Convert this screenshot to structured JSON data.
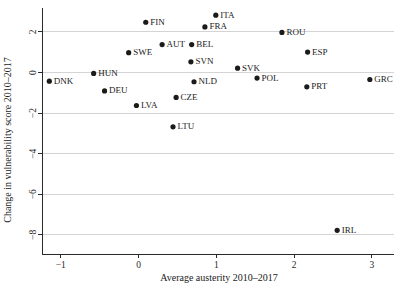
{
  "chart_data": {
    "type": "scatter",
    "title": "",
    "xlabel": "Average austerity 2010–2017",
    "ylabel": "Change in vulnerability score 2010–2017",
    "xlim": [
      -1.35,
      3.15
    ],
    "ylim": [
      -8.6,
      3.2
    ],
    "xticks": [
      -1,
      0,
      1,
      2,
      3
    ],
    "xtick_labels": [
      "−1",
      "0",
      "1",
      "2",
      "3"
    ],
    "yticks": [
      2,
      0,
      -2,
      -4,
      -6,
      -8
    ],
    "ytick_labels": [
      "2",
      "0",
      "−2",
      "−4",
      "−6",
      "−8"
    ],
    "grid": "horizontal",
    "gridlines_y": [
      2,
      0,
      -2,
      -4,
      -6,
      -8
    ],
    "legend": "none",
    "marker": "filled-circle",
    "marker_color": "#1b1b1b",
    "label_position": "right-of-marker",
    "points": [
      {
        "label": "DNK",
        "x": -1.14,
        "y": -0.45
      },
      {
        "label": "HUN",
        "x": -0.57,
        "y": -0.07
      },
      {
        "label": "DEU",
        "x": -0.43,
        "y": -0.93
      },
      {
        "label": "SWE",
        "x": -0.12,
        "y": 0.95
      },
      {
        "label": "LVA",
        "x": -0.02,
        "y": -1.65
      },
      {
        "label": "FIN",
        "x": 0.1,
        "y": 2.45
      },
      {
        "label": "AUT",
        "x": 0.31,
        "y": 1.35
      },
      {
        "label": "LTU",
        "x": 0.45,
        "y": -2.7
      },
      {
        "label": "CZE",
        "x": 0.49,
        "y": -1.25
      },
      {
        "label": "SVN",
        "x": 0.68,
        "y": 0.5
      },
      {
        "label": "BEL",
        "x": 0.69,
        "y": 1.35
      },
      {
        "label": "NLD",
        "x": 0.72,
        "y": -0.48
      },
      {
        "label": "FRA",
        "x": 0.86,
        "y": 2.22
      },
      {
        "label": "ITA",
        "x": 1.0,
        "y": 2.8
      },
      {
        "label": "SVK",
        "x": 1.28,
        "y": 0.19
      },
      {
        "label": "POL",
        "x": 1.53,
        "y": -0.3
      },
      {
        "label": "ROU",
        "x": 1.85,
        "y": 1.95
      },
      {
        "label": "PRT",
        "x": 2.17,
        "y": -0.73
      },
      {
        "label": "ESP",
        "x": 2.18,
        "y": 0.98
      },
      {
        "label": "IRL",
        "x": 2.56,
        "y": -7.8
      },
      {
        "label": "GRC",
        "x": 2.98,
        "y": -0.37
      }
    ]
  },
  "axes": {
    "x_title": "Average austerity 2010–2017",
    "y_title": "Change in vulnerability score 2010–2017"
  }
}
